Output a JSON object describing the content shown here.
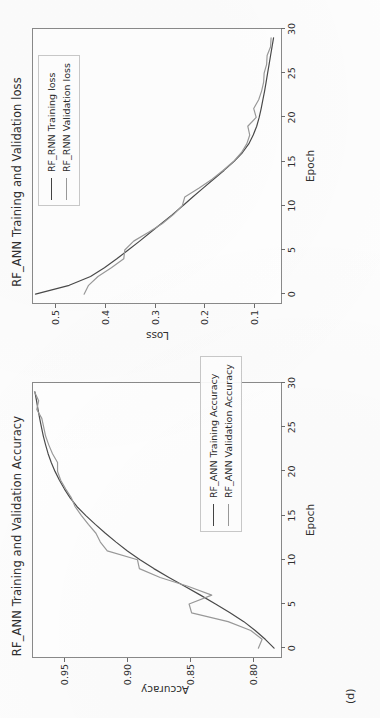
{
  "figure": {
    "sublabel": "(d)",
    "orientation_note": "rotated"
  },
  "colors": {
    "train_line": "#4a4a4a",
    "val_line": "#9a9a9a",
    "axis": "#8a8a8a",
    "text": "#2f2f2f",
    "background": "#ffffff"
  },
  "panels": {
    "accuracy": {
      "title": "RF_ANN Training and Validation Accuracy",
      "xlabel": "Epoch",
      "ylabel": "Accuracy",
      "legend": {
        "train": "RF_ANN Training Accuracy",
        "validation": "RF_ANN Validation Accuracy"
      },
      "xticks": [
        "0",
        "5",
        "10",
        "15",
        "20",
        "25",
        "30"
      ],
      "yticks": [
        "0.80",
        "0.85",
        "0.90",
        "0.95"
      ]
    },
    "loss": {
      "title": "RF_ANN Training and Validation loss",
      "xlabel": "Epoch",
      "ylabel": "Loss",
      "legend": {
        "train": "RF_RNN Training loss",
        "validation": "RF_RNN Validation loss"
      },
      "xticks": [
        "0",
        "5",
        "10",
        "15",
        "20",
        "25",
        "30"
      ],
      "yticks": [
        "0.1",
        "0.2",
        "0.3",
        "0.4",
        "0.5"
      ]
    }
  },
  "chart_data": [
    {
      "type": "line",
      "title": "RF_ANN Training and Validation Accuracy",
      "xlabel": "Epoch",
      "ylabel": "Accuracy",
      "xlim": [
        -1,
        30
      ],
      "ylim": [
        0.778,
        0.975
      ],
      "xticks": [
        0,
        5,
        10,
        15,
        20,
        25,
        30
      ],
      "yticks": [
        0.8,
        0.85,
        0.9,
        0.95
      ],
      "grid": false,
      "legend_position": "lower right",
      "x": [
        0,
        1,
        2,
        3,
        4,
        5,
        6,
        7,
        8,
        9,
        10,
        11,
        12,
        13,
        14,
        15,
        16,
        17,
        18,
        19,
        20,
        21,
        22,
        23,
        24,
        25,
        26,
        27,
        28,
        29
      ],
      "series": [
        {
          "name": "RF_ANN Training Accuracy",
          "color": "#4a4a4a",
          "values": [
            0.7835,
            0.7905,
            0.7985,
            0.8075,
            0.8185,
            0.83,
            0.842,
            0.8545,
            0.867,
            0.879,
            0.89,
            0.9,
            0.909,
            0.9175,
            0.9255,
            0.933,
            0.94,
            0.9455,
            0.95,
            0.954,
            0.9575,
            0.9605,
            0.963,
            0.965,
            0.9668,
            0.9683,
            0.9697,
            0.971,
            0.9722,
            0.9735
          ]
        },
        {
          "name": "RF_ANN Validation Accuracy",
          "color": "#9a9a9a",
          "values": [
            0.796,
            0.793,
            0.802,
            0.82,
            0.849,
            0.851,
            0.833,
            0.852,
            0.874,
            0.8905,
            0.892,
            0.916,
            0.9215,
            0.925,
            0.931,
            0.9365,
            0.9415,
            0.9445,
            0.949,
            0.953,
            0.9555,
            0.9555,
            0.9595,
            0.9625,
            0.965,
            0.9665,
            0.968,
            0.972,
            0.9705,
            0.9738
          ]
        }
      ]
    },
    {
      "type": "line",
      "title": "RF_ANN Training and Validation loss",
      "xlabel": "Epoch",
      "ylabel": "Loss",
      "xlim": [
        -1,
        30
      ],
      "ylim": [
        0.045,
        0.545
      ],
      "xticks": [
        0,
        5,
        10,
        15,
        20,
        25,
        30
      ],
      "yticks": [
        0.1,
        0.2,
        0.3,
        0.4,
        0.5
      ],
      "grid": false,
      "legend_position": "upper right",
      "x": [
        0,
        1,
        2,
        3,
        4,
        5,
        6,
        7,
        8,
        9,
        10,
        11,
        12,
        13,
        14,
        15,
        16,
        17,
        18,
        19,
        20,
        21,
        22,
        23,
        24,
        25,
        26,
        27,
        28,
        29
      ],
      "series": [
        {
          "name": "RF_RNN Training loss",
          "color": "#4a4a4a",
          "values": [
            0.54,
            0.472,
            0.429,
            0.401,
            0.376,
            0.353,
            0.33,
            0.308,
            0.286,
            0.264,
            0.243,
            0.223,
            0.202,
            0.181,
            0.16,
            0.14,
            0.123,
            0.11,
            0.101,
            0.094,
            0.089,
            0.085,
            0.0815,
            0.078,
            0.075,
            0.072,
            0.069,
            0.066,
            0.063,
            0.06
          ]
        },
        {
          "name": "RF_RNN Validation loss",
          "color": "#9a9a9a",
          "values": [
            0.442,
            0.433,
            0.414,
            0.387,
            0.362,
            0.36,
            0.342,
            0.312,
            0.284,
            0.262,
            0.244,
            0.239,
            0.21,
            0.184,
            0.162,
            0.141,
            0.125,
            0.114,
            0.108,
            0.112,
            0.095,
            0.1,
            0.09,
            0.084,
            0.08,
            0.079,
            0.074,
            0.073,
            0.066,
            0.065
          ]
        }
      ]
    }
  ]
}
